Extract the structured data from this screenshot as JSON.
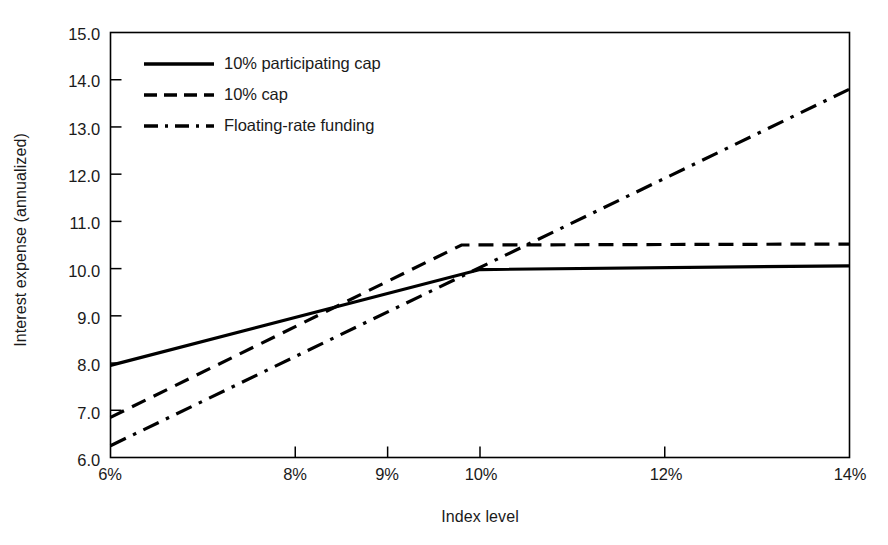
{
  "chart_data": {
    "type": "line",
    "title": "",
    "xlabel": "Index level",
    "ylabel": "Interest expense (annualized)",
    "xlim": [
      6,
      14
    ],
    "ylim": [
      6.0,
      15.0
    ],
    "grid": false,
    "legend_position": "upper-left-inside",
    "x_tick_labels": [
      "6%",
      "8%",
      "9%",
      "10%",
      "12%",
      "14%"
    ],
    "x_tick_values": [
      6,
      8,
      9,
      10,
      12,
      14
    ],
    "y_tick_labels": [
      "6.0",
      "7.0",
      "8.0",
      "9.0",
      "10.0",
      "11.0",
      "12.0",
      "13.0",
      "14.0",
      "15.0"
    ],
    "y_tick_values": [
      6,
      7,
      8,
      9,
      10,
      11,
      12,
      13,
      14,
      15
    ],
    "series": [
      {
        "name": "10% participating cap",
        "style": "solid",
        "color": "#000000",
        "points": [
          [
            6,
            7.95
          ],
          [
            10,
            9.98
          ],
          [
            14,
            10.06
          ]
        ]
      },
      {
        "name": "10% cap",
        "style": "dashed",
        "color": "#000000",
        "points": [
          [
            6,
            6.85
          ],
          [
            9.8,
            10.5
          ],
          [
            14,
            10.52
          ]
        ]
      },
      {
        "name": "Floating-rate funding",
        "style": "dashdot",
        "color": "#000000",
        "points": [
          [
            6,
            6.25
          ],
          [
            14,
            13.8
          ]
        ]
      }
    ]
  },
  "axes": {
    "frame_color": "#000000",
    "frame_sides": [
      "left",
      "bottom",
      "top",
      "right"
    ]
  }
}
